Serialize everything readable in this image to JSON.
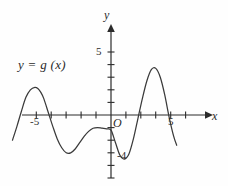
{
  "figure": {
    "kind": "cartesian-graph",
    "background_color": "#fefefe",
    "ink_color": "#2b2b2b",
    "curve_color": "#3a3a3a"
  },
  "labels": {
    "function_label": "y = g (x)",
    "axis_y": "y",
    "axis_x": "x",
    "origin": "O",
    "tick_x_negative_five": "-5",
    "tick_x_positive_five": "5",
    "tick_y_five": "5",
    "tick_y_negative_four": "-4"
  },
  "chart_data": {
    "type": "line",
    "title": "",
    "subtitle": "",
    "xlabel": "x",
    "ylabel": "y",
    "legend": [
      "y = g (x)"
    ],
    "legend_position": "upper-left-inside",
    "grid": false,
    "axis_style": "arrowed-cartesian-axes",
    "xlim": [
      -6.8,
      5.6
    ],
    "ylim": [
      -5.2,
      5.6
    ],
    "x_ticks": [
      -5,
      -4,
      -3,
      -2,
      -1,
      1,
      2,
      3,
      4,
      5
    ],
    "x_tick_labels_shown": [
      -5,
      5
    ],
    "y_ticks": [
      1,
      2,
      3,
      4,
      5,
      -1,
      -2,
      -3,
      -4,
      -5
    ],
    "y_tick_labels_shown": [
      5,
      -4
    ],
    "origin_label": "O",
    "series": [
      {
        "name": "y = g (x)",
        "x": [
          -6.6,
          -6.3,
          -6.0,
          -5.7,
          -5.4,
          -5.1,
          -4.9,
          -4.7,
          -4.5,
          -4.2,
          -3.9,
          -3.6,
          -3.3,
          -3.0,
          -2.7,
          -2.4,
          -2.1,
          -1.8,
          -1.5,
          -1.2,
          -0.9,
          -0.6,
          -0.3,
          0.0,
          0.3,
          0.6,
          0.9,
          1.2,
          1.5,
          1.8,
          2.1,
          2.4,
          2.7,
          3.0,
          3.3,
          3.6,
          3.9,
          4.2,
          4.4
        ],
        "y": [
          -2.0,
          -0.9,
          0.3,
          1.4,
          2.0,
          2.2,
          2.1,
          1.8,
          1.3,
          0.2,
          -0.9,
          -1.9,
          -2.6,
          -3.0,
          -3.0,
          -2.7,
          -2.2,
          -1.7,
          -1.3,
          -1.05,
          -1.0,
          -1.05,
          -1.1,
          -1.2,
          -2.2,
          -3.2,
          -3.5,
          -3.1,
          -1.9,
          -0.3,
          1.3,
          2.7,
          3.6,
          3.7,
          3.0,
          1.6,
          -0.2,
          -1.7,
          -2.4
        ]
      }
    ],
    "features": {
      "local_maxima": [
        {
          "x": -4.9,
          "y": 2.2
        },
        {
          "x": -0.9,
          "y": -1.0
        },
        {
          "x": 2.9,
          "y": 3.7
        }
      ],
      "local_minima": [
        {
          "x": -2.9,
          "y": -3.0
        },
        {
          "x": 0.85,
          "y": -3.5
        }
      ],
      "x_intercepts": [
        -6.0,
        -4.25,
        1.85,
        3.85
      ],
      "y_intercept": -1.2
    }
  }
}
